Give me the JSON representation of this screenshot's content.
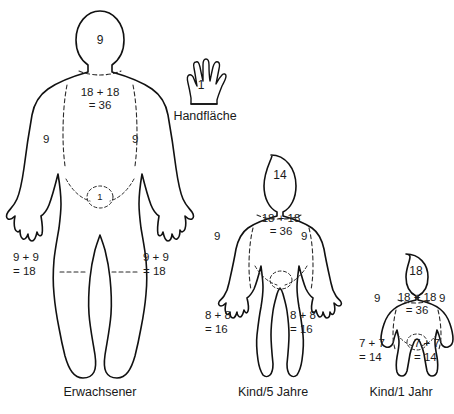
{
  "diagram": {
    "title_visible": false,
    "background_color": "#ffffff",
    "line_color": "#111111",
    "text_color": "#1a1a1a"
  },
  "palm_key": {
    "icon": "hand-palm-icon",
    "value": "1",
    "caption": "Handfläche"
  },
  "figures": [
    {
      "id": "adult",
      "caption": "Erwachsener",
      "labels": {
        "head": "9",
        "arm_left": "9",
        "arm_right": "9",
        "torso_line1": "18 + 18",
        "torso_line2": "= 36",
        "genital": "1",
        "leg_left_line1": "9 + 9",
        "leg_left_line2": "= 18",
        "leg_right_line1": "9 + 9",
        "leg_right_line2": "= 18"
      }
    },
    {
      "id": "child5",
      "caption": "Kind/5 Jahre",
      "labels": {
        "head": "14",
        "arm_left": "9",
        "arm_right": "9",
        "torso_line1": "18 + 18",
        "torso_line2": "= 36",
        "leg_left_line1": "8 + 8",
        "leg_left_line2": "= 16",
        "leg_right_line1": "8 + 8",
        "leg_right_line2": "= 16"
      }
    },
    {
      "id": "infant1",
      "caption": "Kind/1 Jahr",
      "labels": {
        "head": "18",
        "arm_left": "9",
        "arm_right": "9",
        "torso_line1": "18 + 18",
        "torso_line2": "= 36",
        "leg_left_line1": "7 + 7",
        "leg_left_line2": "= 14",
        "leg_right_line1": "7 + 7",
        "leg_right_line2": "= 14"
      }
    }
  ]
}
